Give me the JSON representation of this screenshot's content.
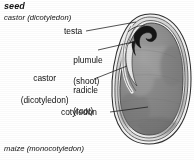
{
  "figure": {
    "title": "seed",
    "caption_top": "castor (dicotyledon)",
    "caption_bottom": "maize (monocotyledon)"
  },
  "labels": {
    "specimen_line1": "castor",
    "specimen_line2": "(dicotyledon)",
    "testa": "testa",
    "plumule_line1": "plumule",
    "plumule_line2": "(shoot)",
    "radicle_line1": "radicle",
    "radicle_line2": "(root)",
    "cotyledon": "cotyledon"
  },
  "colors": {
    "ink": "#111111",
    "leader": "#1a1a1a",
    "seed_body": "#8a8a8a",
    "seed_body_light": "#a2a2a2",
    "seed_body_dark": "#6f6f6f",
    "testa_coat": "#d8d8d8",
    "outline": "#2b2b2b",
    "embryo_dark": "#141414",
    "background": "#ffffff"
  }
}
